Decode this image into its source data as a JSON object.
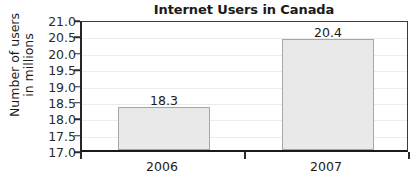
{
  "chart_data": {
    "type": "bar",
    "title": "Internet Users in Canada",
    "xlabel": "",
    "ylabel": "Number of users in millions",
    "ylabel_lines": [
      "Number of users",
      "in millions"
    ],
    "categories": [
      "2006",
      "2007"
    ],
    "values": [
      18.3,
      20.4
    ],
    "value_labels": [
      "18.3",
      "20.4"
    ],
    "ylim": [
      17.0,
      21.0
    ],
    "ytick_step": 0.5,
    "yticks": [
      21.0,
      20.5,
      20.0,
      19.5,
      19.0,
      18.5,
      18.0,
      17.5,
      17.0
    ],
    "ytick_labels": [
      "21.0",
      "20.5",
      "20.0",
      "19.5",
      "19.0",
      "18.5",
      "18.0",
      "17.5",
      "17.0"
    ],
    "grid": true,
    "legend": null,
    "colors": {
      "bar_fill": "#e9e9e9",
      "bar_border": "#a6a6a6",
      "axis": "#1a1a1a",
      "gridline": "#ececec",
      "text": "#1a1a1a",
      "background": "#ffffff"
    }
  }
}
